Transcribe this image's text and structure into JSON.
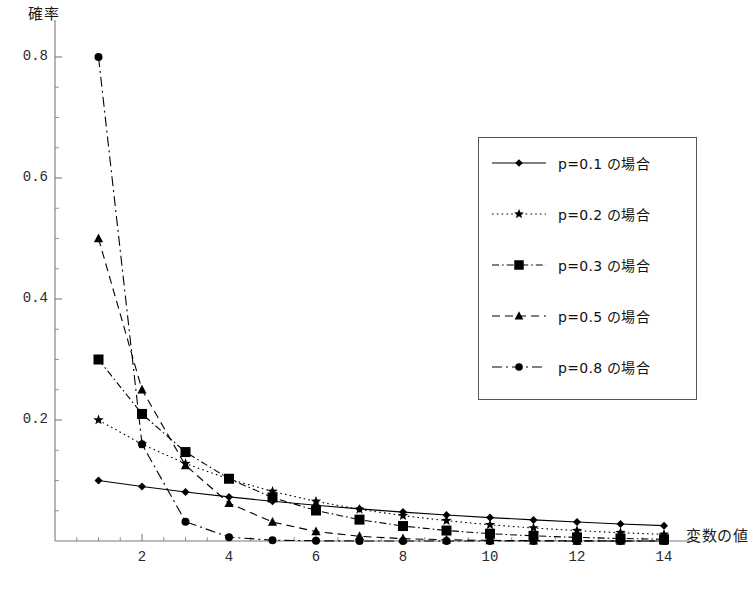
{
  "chart_data": {
    "type": "line",
    "title": "",
    "xlabel": "変数の値",
    "ylabel": "確率",
    "xlim": [
      0,
      14.4
    ],
    "ylim": [
      0,
      0.86
    ],
    "grid": false,
    "legend_position": "right",
    "x": [
      1,
      2,
      3,
      4,
      5,
      6,
      7,
      8,
      9,
      10,
      11,
      12,
      13,
      14
    ],
    "xticks": [
      "2",
      "4",
      "6",
      "8",
      "10",
      "12",
      "14"
    ],
    "xtick_values": [
      2,
      4,
      6,
      8,
      10,
      12,
      14
    ],
    "yticks": [
      "0.2",
      "0.4",
      "0.6",
      "0.8"
    ],
    "ytick_values": [
      0.2,
      0.4,
      0.6,
      0.8
    ],
    "series": [
      {
        "name": "p=0.1 の場合",
        "p": 0.1,
        "marker": "diamond",
        "line_style": "solid",
        "color": "#000000",
        "values": [
          0.1,
          0.09,
          0.081,
          0.0729,
          0.0656,
          0.059,
          0.0531,
          0.0478,
          0.043,
          0.0387,
          0.0349,
          0.0314,
          0.0282,
          0.0254
        ]
      },
      {
        "name": "p=0.2 の場合",
        "p": 0.2,
        "marker": "star",
        "line_style": "dotted",
        "color": "#000000",
        "values": [
          0.2,
          0.16,
          0.128,
          0.1024,
          0.0819,
          0.0655,
          0.0524,
          0.0419,
          0.0336,
          0.0268,
          0.0215,
          0.0172,
          0.0137,
          0.011
        ]
      },
      {
        "name": "p=0.3 の場合",
        "p": 0.3,
        "marker": "square",
        "line_style": "dashdot",
        "color": "#000000",
        "values": [
          0.3,
          0.21,
          0.147,
          0.1029,
          0.072,
          0.0504,
          0.0353,
          0.0247,
          0.0173,
          0.0121,
          0.0085,
          0.0059,
          0.0042,
          0.0029
        ]
      },
      {
        "name": "p=0.5 の場合",
        "p": 0.5,
        "marker": "triangle",
        "line_style": "dashed",
        "color": "#000000",
        "values": [
          0.5,
          0.25,
          0.125,
          0.0625,
          0.0313,
          0.0156,
          0.0078,
          0.0039,
          0.002,
          0.001,
          0.0005,
          0.0002,
          0.0001,
          0.0001
        ]
      },
      {
        "name": "p=0.8 の場合",
        "p": 0.8,
        "marker": "circle",
        "line_style": "longdashdot",
        "color": "#000000",
        "values": [
          0.8,
          0.16,
          0.032,
          0.0064,
          0.0013,
          0.0003,
          0.0001,
          0.0,
          0.0,
          0.0,
          0.0,
          0.0,
          0.0,
          0.0
        ]
      }
    ]
  },
  "legend": {
    "items": [
      {
        "label": "p=0.1 の場合"
      },
      {
        "label": "p=0.2 の場合"
      },
      {
        "label": "p=0.3 の場合"
      },
      {
        "label": "p=0.5 の場合"
      },
      {
        "label": "p=0.8 の場合"
      }
    ]
  },
  "axes": {
    "y_title": "確率",
    "x_title": "変数の値",
    "y_tick_labels": [
      "0.8",
      "0.6",
      "0.4",
      "0.2"
    ],
    "x_tick_labels": [
      "2",
      "4",
      "6",
      "8",
      "10",
      "12",
      "14"
    ]
  }
}
